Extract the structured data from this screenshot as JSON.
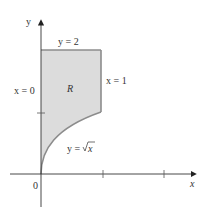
{
  "diagram": {
    "axes": {
      "x_label": "x",
      "y_label": "y",
      "origin_label": "0"
    },
    "region": {
      "label": "R",
      "fill_color": "#d9d9d9",
      "edge_color": "#8c8c8c"
    },
    "boundaries": {
      "top": "y = 2",
      "right": "x = 1",
      "left": "x = 0",
      "curve_prefix": "y = ",
      "curve_expr": "x"
    },
    "ticks": {
      "x": [
        1,
        2
      ],
      "y": [
        1
      ]
    }
  }
}
